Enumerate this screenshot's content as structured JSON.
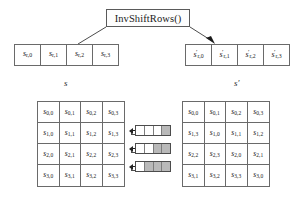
{
  "diagram": {
    "operation_label": "InvShiftRows()",
    "input_caption": "s",
    "output_caption": "s′"
  },
  "input_row": {
    "name": "s",
    "cells": [
      {
        "base": "s",
        "sub": "r,0",
        "prime": false
      },
      {
        "base": "s",
        "sub": "r,1",
        "prime": false
      },
      {
        "base": "s",
        "sub": "r,2",
        "prime": false
      },
      {
        "base": "s",
        "sub": "r,3",
        "prime": false
      }
    ]
  },
  "output_row": {
    "name": "s'",
    "cells": [
      {
        "base": "s",
        "sub": "r,0",
        "prime": true
      },
      {
        "base": "s",
        "sub": "r,1",
        "prime": true
      },
      {
        "base": "s",
        "sub": "r,2",
        "prime": true
      },
      {
        "base": "s",
        "sub": "r,3",
        "prime": true
      }
    ]
  },
  "input_matrix": {
    "rows": [
      [
        "s0,0",
        "s0,1",
        "s0,2",
        "s0,3"
      ],
      [
        "s1,0",
        "s1,1",
        "s1,2",
        "s1,3"
      ],
      [
        "s2,0",
        "s2,1",
        "s2,2",
        "s2,3"
      ],
      [
        "s3,0",
        "s3,1",
        "s3,2",
        "s3,3"
      ]
    ],
    "subs": [
      [
        "0,0",
        "0,1",
        "0,2",
        "0,3"
      ],
      [
        "1,0",
        "1,1",
        "1,2",
        "1,3"
      ],
      [
        "2,0",
        "2,1",
        "2,2",
        "2,3"
      ],
      [
        "3,0",
        "3,1",
        "3,2",
        "3,3"
      ]
    ]
  },
  "output_matrix": {
    "rows": [
      [
        "s0,0",
        "s0,1",
        "s0,2",
        "s0,3"
      ],
      [
        "s1,3",
        "s1,0",
        "s1,1",
        "s1,2"
      ],
      [
        "s2,2",
        "s2,3",
        "s2,0",
        "s2,1"
      ],
      [
        "s3,1",
        "s3,2",
        "s3,3",
        "s3,0"
      ]
    ],
    "subs": [
      [
        "0,0",
        "0,1",
        "0,2",
        "0,3"
      ],
      [
        "1,3",
        "1,0",
        "1,1",
        "1,2"
      ],
      [
        "2,2",
        "2,3",
        "2,0",
        "2,1"
      ],
      [
        "3,1",
        "3,2",
        "3,3",
        "3,0"
      ]
    ]
  },
  "shift_icons": [
    {
      "name": "shift-row-1",
      "shift": 1,
      "segments": 4
    },
    {
      "name": "shift-row-2",
      "shift": 2,
      "segments": 4
    },
    {
      "name": "shift-row-3",
      "shift": 3,
      "segments": 4
    }
  ],
  "colors": {
    "stroke": "#6a6a6a",
    "text": "#1a1a1a",
    "fill_shaded": "#b9b9b9",
    "background": "#ffffff"
  }
}
